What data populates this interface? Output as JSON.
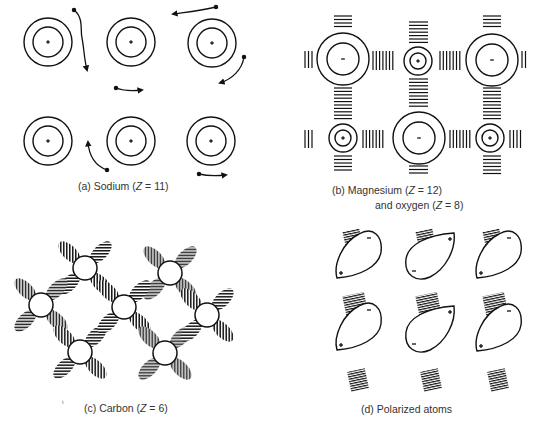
{
  "figure": {
    "colors": {
      "ink": "#111111",
      "caption": "#333333",
      "background": "#ffffff"
    },
    "panels": [
      {
        "id": "a",
        "caption": "(a) Sodium (Z = 11)",
        "caption_parts": {
          "prefix": "(a) Sodium (",
          "var": "Z",
          "suffix": " = 11)"
        },
        "bond_type": "metallic",
        "atoms": [
          {
            "cx": 48,
            "cy": 42,
            "charge": "+"
          },
          {
            "cx": 131,
            "cy": 42,
            "charge": "+"
          },
          {
            "cx": 212,
            "cy": 43,
            "charge": "+"
          },
          {
            "cx": 48,
            "cy": 141,
            "charge": "+"
          },
          {
            "cx": 131,
            "cy": 141,
            "charge": "+"
          },
          {
            "cx": 211,
            "cy": 141,
            "charge": "+"
          }
        ],
        "electron_paths": 6
      },
      {
        "id": "b",
        "caption": "(b) Magnesium (Z = 12)",
        "caption_parts": {
          "prefix": "(b) Magnesium (",
          "var": "Z",
          "suffix": " = 12)"
        },
        "caption_line2": "and oxygen (Z = 8)",
        "caption_line2_parts": {
          "prefix": "and oxygen (",
          "var": "Z",
          "suffix": " = 8)"
        },
        "bond_type": "ionic",
        "atoms": [
          {
            "cx": 343,
            "cy": 59,
            "charge": "-",
            "element": "O"
          },
          {
            "cx": 418,
            "cy": 61,
            "charge": "+",
            "element": "Mg"
          },
          {
            "cx": 492,
            "cy": 60,
            "charge": "-",
            "element": "O"
          },
          {
            "cx": 343,
            "cy": 138,
            "charge": "+",
            "element": "Mg"
          },
          {
            "cx": 419,
            "cy": 138,
            "charge": "-",
            "element": "O"
          },
          {
            "cx": 490,
            "cy": 138,
            "charge": "+",
            "element": "Mg"
          }
        ]
      },
      {
        "id": "c",
        "caption": "(c) Carbon (Z = 6)",
        "caption_parts": {
          "prefix": "(c) Carbon (",
          "var": "Z",
          "suffix": " = 6)"
        },
        "bond_type": "covalent",
        "atoms": [
          {
            "cx": 85,
            "cy": 268
          },
          {
            "cx": 41,
            "cy": 305
          },
          {
            "cx": 80,
            "cy": 352
          },
          {
            "cx": 170,
            "cy": 273
          },
          {
            "cx": 124,
            "cy": 307
          },
          {
            "cx": 165,
            "cy": 353
          },
          {
            "cx": 207,
            "cy": 315
          }
        ]
      },
      {
        "id": "d",
        "caption": "(d) Polarized atoms",
        "bond_type": "van-der-waals",
        "dipoles": [
          {
            "col": 1,
            "row": 1,
            "top_charge": "-",
            "bottom_charge": "+"
          },
          {
            "col": 1,
            "row": 2,
            "top_charge": "-",
            "bottom_charge": "+"
          },
          {
            "col": 2,
            "row": 1,
            "top_charge": "+",
            "bottom_charge": "-"
          },
          {
            "col": 2,
            "row": 2,
            "top_charge": "+",
            "bottom_charge": "-"
          },
          {
            "col": 3,
            "row": 1,
            "top_charge": "-",
            "bottom_charge": "+"
          },
          {
            "col": 3,
            "row": 2,
            "top_charge": "-",
            "bottom_charge": "+"
          }
        ]
      }
    ],
    "stray_mark": "t"
  }
}
